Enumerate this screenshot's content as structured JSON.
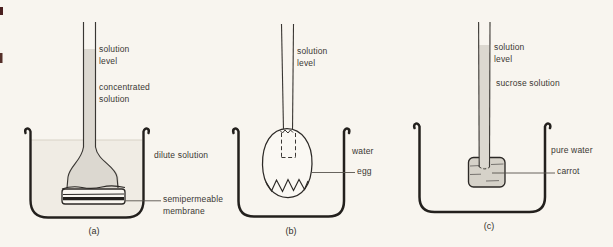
{
  "figure": {
    "colors": {
      "background": "#f8f5ef",
      "ink": "#23201d",
      "thin_line": "#3a3733",
      "solution_fill": "#dcd8d0",
      "carrot_fill": "#d6d2c9",
      "bath_fill": "#f0ece4",
      "pointer": "#57534d",
      "scan_mark": "#4a1f1f"
    },
    "panels": [
      {
        "caption": "(a)",
        "labels": {
          "solution_level": "solution\nlevel",
          "tube_content": "concentrated\nsolution",
          "bath": "dilute solution",
          "barrier": "semipermeable\nmembrane"
        }
      },
      {
        "caption": "(b)",
        "labels": {
          "solution_level": "solution\nlevel",
          "bath": "water",
          "barrier": "egg"
        }
      },
      {
        "caption": "(c)",
        "labels": {
          "solution_level": "solution\nlevel",
          "tube_content": "sucrose solution",
          "bath": "pure water",
          "barrier": "carrot"
        }
      }
    ]
  }
}
